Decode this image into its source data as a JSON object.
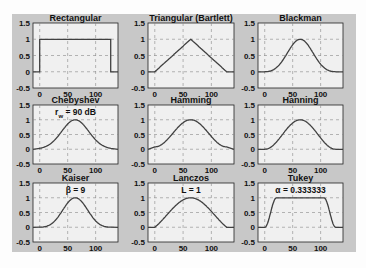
{
  "figure": {
    "background": "#c8c8c8",
    "axes_background": "#f0f0f0",
    "line_color": "#404040",
    "grid_color": "#888888"
  },
  "chart_data": [
    {
      "type": "line",
      "title": "Rectangular",
      "annotation": "",
      "window": "rectangular",
      "x_range": [
        -12,
        140
      ],
      "ylim": [
        -0.5,
        1.5
      ],
      "xticks": [
        0,
        50,
        100
      ],
      "yticks": [
        -0.5,
        0,
        0.5,
        1,
        1.5
      ],
      "grid": true,
      "xlabel": "",
      "ylabel": "",
      "support": [
        0,
        128
      ]
    },
    {
      "type": "line",
      "title": "Triangular (Bartlett)",
      "annotation": "",
      "window": "bartlett",
      "x_range": [
        -12,
        140
      ],
      "ylim": [
        -0.5,
        1.5
      ],
      "xticks": [
        0,
        50,
        100
      ],
      "yticks": [
        -0.5,
        0,
        0.5,
        1,
        1.5
      ],
      "grid": true,
      "xlabel": "",
      "ylabel": "",
      "support": [
        0,
        128
      ]
    },
    {
      "type": "line",
      "title": "Blackman",
      "annotation": "",
      "window": "blackman",
      "x_range": [
        -12,
        140
      ],
      "ylim": [
        -0.5,
        1.5
      ],
      "xticks": [
        0,
        50,
        100
      ],
      "yticks": [
        -0.5,
        0,
        0.5,
        1,
        1.5
      ],
      "grid": true,
      "xlabel": "",
      "ylabel": "",
      "support": [
        0,
        128
      ]
    },
    {
      "type": "line",
      "title": "Chebyshev",
      "annotation": "r_w = 90 dB",
      "window": "chebyshev",
      "x_range": [
        -12,
        140
      ],
      "ylim": [
        -0.5,
        1.5
      ],
      "xticks": [
        0,
        50,
        100
      ],
      "yticks": [
        -0.5,
        0,
        0.5,
        1,
        1.5
      ],
      "grid": true,
      "xlabel": "",
      "ylabel": "",
      "support": [
        0,
        128
      ]
    },
    {
      "type": "line",
      "title": "Hamming",
      "annotation": "",
      "window": "hamming",
      "x_range": [
        -12,
        140
      ],
      "ylim": [
        -0.5,
        1.5
      ],
      "xticks": [
        0,
        50,
        100
      ],
      "yticks": [
        -0.5,
        0,
        0.5,
        1,
        1.5
      ],
      "grid": true,
      "xlabel": "",
      "ylabel": "",
      "support": [
        0,
        128
      ]
    },
    {
      "type": "line",
      "title": "Hanning",
      "annotation": "",
      "window": "hanning",
      "x_range": [
        -12,
        140
      ],
      "ylim": [
        -0.5,
        1.5
      ],
      "xticks": [
        0,
        50,
        100
      ],
      "yticks": [
        -0.5,
        0,
        0.5,
        1,
        1.5
      ],
      "grid": true,
      "xlabel": "",
      "ylabel": "",
      "support": [
        0,
        128
      ]
    },
    {
      "type": "line",
      "title": "Kaiser",
      "annotation": "β = 9",
      "window": "kaiser",
      "x_range": [
        -12,
        140
      ],
      "ylim": [
        -0.5,
        1.5
      ],
      "xticks": [
        0,
        50,
        100
      ],
      "yticks": [
        -0.5,
        0,
        0.5,
        1,
        1.5
      ],
      "grid": true,
      "xlabel": "",
      "ylabel": "",
      "support": [
        0,
        128
      ]
    },
    {
      "type": "line",
      "title": "Lanczos",
      "annotation": "L = 1",
      "window": "lanczos",
      "x_range": [
        -12,
        140
      ],
      "ylim": [
        -0.5,
        1.5
      ],
      "xticks": [
        0,
        50,
        100
      ],
      "yticks": [
        -0.5,
        0,
        0.5,
        1,
        1.5
      ],
      "grid": true,
      "xlabel": "",
      "ylabel": "",
      "support": [
        0,
        128
      ]
    },
    {
      "type": "line",
      "title": "Tukey",
      "annotation": "α = 0.333333",
      "window": "tukey",
      "x_range": [
        -12,
        140
      ],
      "ylim": [
        -0.5,
        1.5
      ],
      "xticks": [
        0,
        50,
        100
      ],
      "yticks": [
        -0.5,
        0,
        0.5,
        1,
        1.5
      ],
      "grid": true,
      "xlabel": "",
      "ylabel": "",
      "support": [
        0,
        128
      ]
    }
  ]
}
